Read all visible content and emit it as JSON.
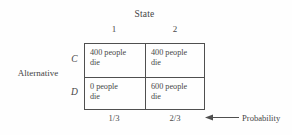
{
  "figure": {
    "column_group_title": "State",
    "row_group_title": "Alternative",
    "columns": [
      {
        "label": "1",
        "probability": "1/3"
      },
      {
        "label": "2",
        "probability": "2/3"
      }
    ],
    "rows": [
      {
        "label": "C"
      },
      {
        "label": "D"
      }
    ],
    "cells": [
      [
        {
          "line1": "400 people",
          "line2": "die"
        },
        {
          "line1": "400 people",
          "line2": "die"
        }
      ],
      [
        {
          "line1": "0 people",
          "line2": "die"
        },
        {
          "line1": "600 people",
          "line2": "die"
        }
      ]
    ],
    "probability_caption": "Probability",
    "colors": {
      "background": "#fefefe",
      "border": "#4f4f4f",
      "text": "#4a4a4a"
    }
  }
}
